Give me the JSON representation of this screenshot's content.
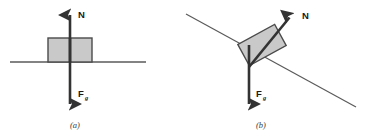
{
  "figure": {
    "type": "physics-free-body-diagram",
    "background_color": "#ffffff",
    "stroke_color": "#3b3b3b",
    "arrow_color": "#333333",
    "block_fill": "#c9c9c9",
    "block_stroke": "#4a4a4a"
  },
  "panels": [
    {
      "id": "a",
      "caption": "(a)",
      "caption_x": 75,
      "caption_y": 128,
      "surface": {
        "name": "horizontal-surface",
        "x1": 10,
        "y1": 62,
        "x2": 146,
        "y2": 62
      },
      "block": {
        "name": "block",
        "x": 48,
        "y": 38,
        "width": 44,
        "height": 24,
        "rotation": 0
      },
      "forces": [
        {
          "name": "normal-force",
          "label": "N",
          "subscript": "",
          "label_x": 78,
          "label_y": 18,
          "x1": 70,
          "y1": 62,
          "x2": 70,
          "y2": 11,
          "direction": "up"
        },
        {
          "name": "gravitational-force",
          "label": "F",
          "subscript": "g",
          "label_x": 78,
          "label_y": 97,
          "x1": 70,
          "y1": 38,
          "x2": 70,
          "y2": 108,
          "direction": "down"
        }
      ]
    },
    {
      "id": "b",
      "caption": "(b)",
      "caption_x": 261,
      "caption_y": 128,
      "surface": {
        "name": "inclined-surface",
        "x1": 186,
        "y1": 14,
        "x2": 356,
        "y2": 107,
        "angle_deg": 28.7
      },
      "block": {
        "name": "block",
        "cx": 262,
        "cy": 45,
        "width": 42,
        "height": 24,
        "rotation": -28.7
      },
      "forces": [
        {
          "name": "normal-force",
          "label": "N",
          "subscript": "",
          "label_x": 303,
          "label_y": 19,
          "x1": 249,
          "y1": 67,
          "x2": 292,
          "y2": 14,
          "direction": "up-right-perpendicular-to-incline"
        },
        {
          "name": "gravitational-force",
          "label": "F",
          "subscript": "g",
          "label_x": 253,
          "label_y": 97,
          "x1": 249,
          "y1": 45,
          "x2": 249,
          "y2": 108,
          "direction": "down"
        }
      ]
    }
  ]
}
